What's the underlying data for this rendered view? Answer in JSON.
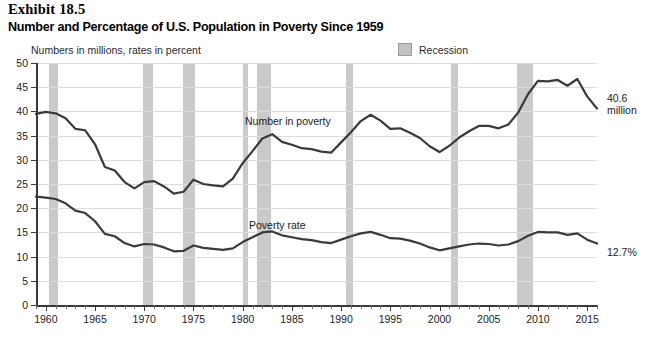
{
  "exhibit": {
    "number": "Exhibit 18.5",
    "title": "Number and Percentage of U.S. Population in Poverty Since 1959"
  },
  "notes": {
    "units": "Numbers in millions, rates in percent"
  },
  "legend": {
    "recession_label": "Recession",
    "recession_color": "#c6c6c6"
  },
  "annotations": {
    "number_in_poverty": "Number in poverty",
    "poverty_rate": "Poverty rate",
    "end_number": "40.6",
    "end_number_unit": "million",
    "end_rate": "12.7%"
  },
  "chart_data": {
    "type": "line",
    "title": "Number and Percentage of U.S. Population in Poverty Since 1959",
    "subtitle": "Numbers in millions, rates in percent",
    "xlabel": "",
    "ylabel": "",
    "xlim": [
      1959,
      2016
    ],
    "ylim": [
      0,
      50
    ],
    "ytick_step": 5,
    "yticks": [
      0,
      5,
      10,
      15,
      20,
      25,
      30,
      35,
      40,
      45,
      50
    ],
    "xticks": [
      1960,
      1965,
      1970,
      1975,
      1980,
      1985,
      1990,
      1995,
      2000,
      2005,
      2010,
      2015
    ],
    "xtick_minor_step": 1,
    "grid": true,
    "legend_position": "top-right",
    "line_color": "#3a3a3a",
    "x": [
      1959,
      1960,
      1961,
      1962,
      1963,
      1964,
      1965,
      1966,
      1967,
      1968,
      1969,
      1970,
      1971,
      1972,
      1973,
      1974,
      1975,
      1976,
      1977,
      1978,
      1979,
      1980,
      1981,
      1982,
      1983,
      1984,
      1985,
      1986,
      1987,
      1988,
      1989,
      1990,
      1991,
      1992,
      1993,
      1994,
      1995,
      1996,
      1997,
      1998,
      1999,
      2000,
      2001,
      2002,
      2003,
      2004,
      2005,
      2006,
      2007,
      2008,
      2009,
      2010,
      2011,
      2012,
      2013,
      2014,
      2015,
      2016
    ],
    "series": [
      {
        "name": "Number in poverty",
        "unit": "millions",
        "end_value": 40.6,
        "values": [
          39.5,
          39.9,
          39.6,
          38.6,
          36.4,
          36.1,
          33.2,
          28.5,
          27.8,
          25.4,
          24.1,
          25.4,
          25.6,
          24.5,
          23.0,
          23.4,
          25.9,
          25.0,
          24.7,
          24.5,
          26.1,
          29.3,
          31.8,
          34.4,
          35.3,
          33.7,
          33.1,
          32.4,
          32.2,
          31.7,
          31.5,
          33.6,
          35.7,
          38.0,
          39.3,
          38.1,
          36.4,
          36.5,
          35.6,
          34.5,
          32.8,
          31.6,
          32.9,
          34.6,
          35.9,
          37.0,
          37.0,
          36.5,
          37.3,
          39.8,
          43.6,
          46.3,
          46.2,
          46.5,
          45.3,
          46.7,
          43.1,
          40.6
        ]
      },
      {
        "name": "Poverty rate",
        "unit": "percent",
        "end_value": 12.7,
        "values": [
          22.4,
          22.2,
          21.9,
          21.0,
          19.5,
          19.0,
          17.3,
          14.7,
          14.2,
          12.8,
          12.1,
          12.6,
          12.5,
          11.9,
          11.1,
          11.2,
          12.3,
          11.8,
          11.6,
          11.4,
          11.7,
          13.0,
          14.0,
          15.0,
          15.2,
          14.4,
          14.0,
          13.6,
          13.4,
          13.0,
          12.8,
          13.5,
          14.2,
          14.8,
          15.1,
          14.5,
          13.8,
          13.7,
          13.3,
          12.7,
          11.9,
          11.3,
          11.7,
          12.1,
          12.5,
          12.7,
          12.6,
          12.3,
          12.5,
          13.2,
          14.3,
          15.1,
          15.0,
          15.0,
          14.5,
          14.8,
          13.5,
          12.7
        ]
      }
    ],
    "recessions": [
      {
        "start": 1960.3,
        "end": 1961.2
      },
      {
        "start": 1969.9,
        "end": 1970.9
      },
      {
        "start": 1973.9,
        "end": 1975.2
      },
      {
        "start": 1980.0,
        "end": 1980.5
      },
      {
        "start": 1981.5,
        "end": 1982.9
      },
      {
        "start": 1990.5,
        "end": 1991.2
      },
      {
        "start": 2001.2,
        "end": 2001.9
      },
      {
        "start": 2007.9,
        "end": 2009.5
      }
    ]
  }
}
